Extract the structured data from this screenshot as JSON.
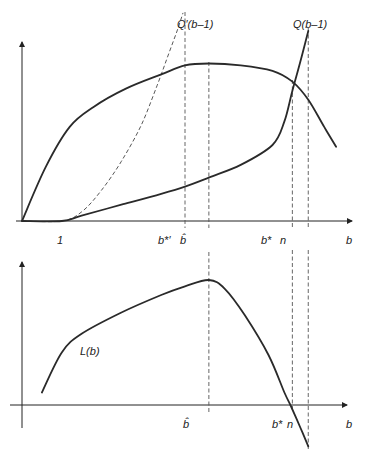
{
  "chart_data": [
    {
      "type": "line",
      "panel": "top",
      "title": "",
      "xlabel": "b",
      "ylabel": "",
      "grid": false,
      "x_ticks": [
        {
          "label": "1",
          "x": 1
        },
        {
          "label": "b*'",
          "x": 4.1
        },
        {
          "label": "b̂",
          "x": 4.7
        },
        {
          "label": "b*",
          "x": 6.8
        },
        {
          "label": "n",
          "x": 7.2
        }
      ],
      "xlim": [
        0,
        8.3
      ],
      "ylim": [
        0,
        1.0
      ],
      "series": [
        {
          "name": "Q'(b–1)",
          "style": "dashed",
          "points": [
            [
              0,
              0
            ],
            [
              1,
              0
            ],
            [
              1.5,
              0.05
            ],
            [
              2,
              0.17
            ],
            [
              2.5,
              0.33
            ],
            [
              3,
              0.53
            ],
            [
              3.4,
              0.75
            ],
            [
              3.7,
              0.93
            ],
            [
              3.9,
              1.05
            ],
            [
              4.05,
              1.15
            ]
          ]
        },
        {
          "name": "Q(b–1)",
          "style": "solid",
          "points": [
            [
              0,
              0
            ],
            [
              1,
              0
            ],
            [
              1.5,
              0.03
            ],
            [
              2.5,
              0.09
            ],
            [
              3.5,
              0.15
            ],
            [
              4.1,
              0.19
            ],
            [
              4.7,
              0.24
            ],
            [
              5.5,
              0.31
            ],
            [
              6.3,
              0.42
            ],
            [
              6.6,
              0.55
            ],
            [
              6.8,
              0.72
            ],
            [
              7.0,
              0.88
            ],
            [
              7.2,
              1.05
            ]
          ]
        },
        {
          "name": "",
          "style": "solid",
          "points": [
            [
              0,
              0
            ],
            [
              0.6,
              0.3
            ],
            [
              1.2,
              0.52
            ],
            [
              1.8,
              0.63
            ],
            [
              2.6,
              0.73
            ],
            [
              3.5,
              0.81
            ],
            [
              4.1,
              0.86
            ],
            [
              4.7,
              0.87
            ],
            [
              5.5,
              0.86
            ],
            [
              6.3,
              0.83
            ],
            [
              6.8,
              0.77
            ],
            [
              7.2,
              0.67
            ],
            [
              7.6,
              0.52
            ],
            [
              7.9,
              0.41
            ]
          ]
        }
      ],
      "annotations": [
        "Q'(b–1)",
        "Q(b–1)"
      ]
    },
    {
      "type": "line",
      "panel": "bottom",
      "title": "",
      "xlabel": "b",
      "ylabel": "",
      "grid": false,
      "x_ticks": [
        {
          "label": "b̂",
          "x": 4.7
        },
        {
          "label": "b*",
          "x": 6.8
        },
        {
          "label": "n",
          "x": 7.2
        }
      ],
      "xlim": [
        -0.3,
        8.3
      ],
      "ylim": [
        -0.35,
        1.0
      ],
      "series": [
        {
          "name": "L(b)",
          "style": "solid",
          "points": [
            [
              0.5,
              0.1
            ],
            [
              1,
              0.42
            ],
            [
              1.5,
              0.57
            ],
            [
              2.5,
              0.74
            ],
            [
              3.5,
              0.88
            ],
            [
              4.1,
              0.95
            ],
            [
              4.7,
              1.0
            ],
            [
              5.1,
              0.93
            ],
            [
              5.6,
              0.72
            ],
            [
              6.2,
              0.4
            ],
            [
              6.6,
              0.1
            ],
            [
              6.75,
              0.0
            ],
            [
              7.0,
              -0.18
            ],
            [
              7.2,
              -0.33
            ]
          ]
        }
      ],
      "annotations": [
        "L(b)"
      ]
    }
  ],
  "labels": {
    "q_prime": "Q′(b–1)",
    "q": "Q(b–1)",
    "l": "L(b)",
    "one": "1",
    "b_star_prime": "b*′",
    "b_hat": "b̂",
    "b_star": "b*",
    "n": "n",
    "b": "b"
  }
}
